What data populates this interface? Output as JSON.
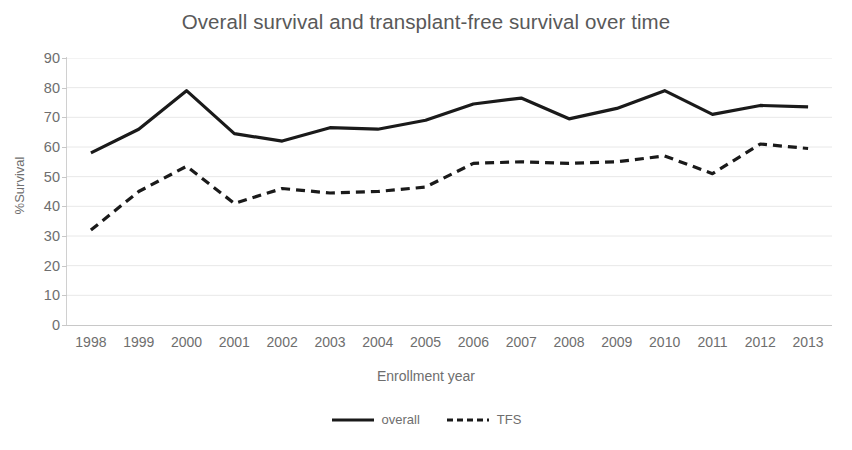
{
  "chart_data": {
    "type": "line",
    "title": "Overall survival and transplant-free survival over time",
    "xlabel": "Enrollment year",
    "ylabel": "%Survival",
    "categories": [
      "1998",
      "1999",
      "2000",
      "2001",
      "2002",
      "2003",
      "2004",
      "2005",
      "2006",
      "2007",
      "2008",
      "2009",
      "2010",
      "2011",
      "2012",
      "2013"
    ],
    "x": [
      1998,
      1999,
      2000,
      2001,
      2002,
      2003,
      2004,
      2005,
      2006,
      2007,
      2008,
      2009,
      2010,
      2011,
      2012,
      2013
    ],
    "ylim": [
      0,
      90
    ],
    "yticks": [
      0,
      10,
      20,
      30,
      40,
      50,
      60,
      70,
      80,
      90
    ],
    "ytick_labels": [
      "0",
      "10",
      "20",
      "30",
      "40",
      "50",
      "60",
      "70",
      "80",
      "90"
    ],
    "grid": true,
    "grid_axis": "y",
    "legend_position": "bottom",
    "series": [
      {
        "name": "overall",
        "style": "solid",
        "color": "#1a1a1a",
        "values": [
          58,
          66,
          79,
          64.5,
          62,
          66.5,
          66,
          69,
          74.5,
          76.5,
          69.5,
          73,
          79,
          71,
          74,
          73.5
        ]
      },
      {
        "name": "TFS",
        "style": "dashed",
        "color": "#1a1a1a",
        "values": [
          32,
          45,
          53.5,
          41,
          46,
          44.5,
          45,
          46.5,
          54.5,
          55,
          54.5,
          55,
          57,
          51,
          61,
          59.5
        ]
      }
    ]
  },
  "legend": {
    "entries": [
      {
        "label": "overall",
        "icon": "solid-line-swatch"
      },
      {
        "label": "TFS",
        "icon": "dashed-line-swatch"
      }
    ]
  },
  "colors": {
    "line": "#1a1a1a",
    "text": "#6e6e6e",
    "title": "#595959",
    "grid": "#e8e8e8",
    "axis": "#c8c8c8",
    "background": "#ffffff"
  }
}
